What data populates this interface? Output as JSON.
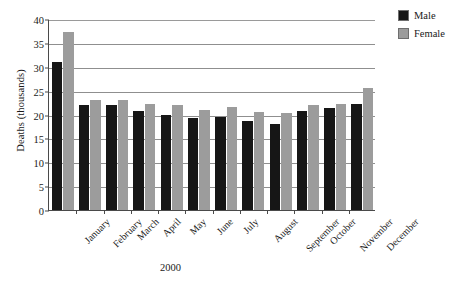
{
  "chart_data": {
    "type": "bar",
    "title": "",
    "xlabel": "2000",
    "ylabel": "Deaths (thousands)",
    "ylim": [
      0,
      40
    ],
    "ytick_step": 5,
    "yticks": [
      0,
      5,
      10,
      15,
      20,
      25,
      30,
      35,
      40
    ],
    "grid": true,
    "grid_axis": "y",
    "legend_position": "right-top",
    "categories": [
      "January",
      "February",
      "March",
      "April",
      "May",
      "June",
      "July",
      "August",
      "September",
      "October",
      "November",
      "December"
    ],
    "series": [
      {
        "name": "Male",
        "color": "#161616",
        "values": [
          31.0,
          22.0,
          22.0,
          20.8,
          20.0,
          19.2,
          19.4,
          18.6,
          18.0,
          20.8,
          21.4,
          22.3
        ]
      },
      {
        "name": "Female",
        "color": "#9c9c9c",
        "values": [
          37.2,
          23.0,
          23.0,
          22.3,
          22.0,
          21.0,
          21.5,
          20.5,
          20.4,
          21.9,
          22.3,
          25.5
        ]
      }
    ]
  },
  "legend": {
    "items": [
      {
        "label": "Male",
        "swatch": "male-swatch"
      },
      {
        "label": "Female",
        "swatch": "female-swatch"
      }
    ]
  },
  "axes": {
    "y_title": "Deaths (thousands)",
    "x_title": "2000"
  }
}
